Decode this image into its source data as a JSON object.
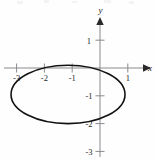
{
  "figure": {
    "width": 156,
    "height": 159,
    "background_color": "#fefefe",
    "curve_color": "#121212",
    "axis_color": "#8a8a8f",
    "label_color": "#1a1a1a"
  },
  "axes": {
    "x_axis_label": "x",
    "y_axis_label": "y",
    "origin_px": {
      "x": 100,
      "y": 68
    },
    "unit_px": 27.8,
    "x_axis_arrow": "arrow-right",
    "y_axis_arrow": "arrow-up",
    "x_tick_labels": [
      "-3",
      "-2",
      "-1",
      "1"
    ],
    "x_tick_values": [
      -3,
      -2,
      -1,
      1
    ],
    "y_tick_labels": [
      "1",
      "-1",
      "-2",
      "-3"
    ],
    "y_tick_values": [
      1,
      -1,
      -2,
      -3
    ]
  },
  "chart_data": {
    "type": "line",
    "title": "",
    "xlabel": "x",
    "ylabel": "y",
    "xlim": [
      -3.6,
      1.6
    ],
    "ylim": [
      -3.3,
      1.6
    ],
    "grid": false,
    "legend": "none",
    "x_ticks": [
      -3,
      -2,
      -1,
      1
    ],
    "y_ticks": [
      1,
      -1,
      -2,
      -3
    ],
    "series": [
      {
        "name": "ellipse",
        "shape": "ellipse",
        "center": [
          -1.15,
          -0.95
        ],
        "semi_axis_x": 2.05,
        "semi_axis_y": 1.05,
        "closed": true,
        "stroke_color": "#121212",
        "stroke_width": 1.6,
        "x_extent": [
          -3.2,
          0.9
        ],
        "y_extent": [
          -2.0,
          0.1
        ],
        "points": [
          [
            0.9,
            -0.95
          ],
          [
            0.85,
            -0.62
          ],
          [
            0.7,
            -0.36
          ],
          [
            0.46,
            -0.15
          ],
          [
            0.15,
            -0.01
          ],
          [
            -0.2,
            0.07
          ],
          [
            -0.6,
            0.1
          ],
          [
            -1.15,
            0.1
          ],
          [
            -1.7,
            0.1
          ],
          [
            -2.1,
            0.07
          ],
          [
            -2.45,
            -0.01
          ],
          [
            -2.76,
            -0.15
          ],
          [
            -3.0,
            -0.36
          ],
          [
            -3.15,
            -0.62
          ],
          [
            -3.2,
            -0.95
          ],
          [
            -3.15,
            -1.28
          ],
          [
            -3.0,
            -1.54
          ],
          [
            -2.76,
            -1.75
          ],
          [
            -2.45,
            -1.89
          ],
          [
            -2.1,
            -1.97
          ],
          [
            -1.7,
            -2.0
          ],
          [
            -1.15,
            -2.0
          ],
          [
            -0.6,
            -2.0
          ],
          [
            -0.2,
            -1.97
          ],
          [
            0.15,
            -1.89
          ],
          [
            0.46,
            -1.75
          ],
          [
            0.7,
            -1.54
          ],
          [
            0.85,
            -1.28
          ],
          [
            0.9,
            -0.95
          ]
        ]
      }
    ]
  }
}
